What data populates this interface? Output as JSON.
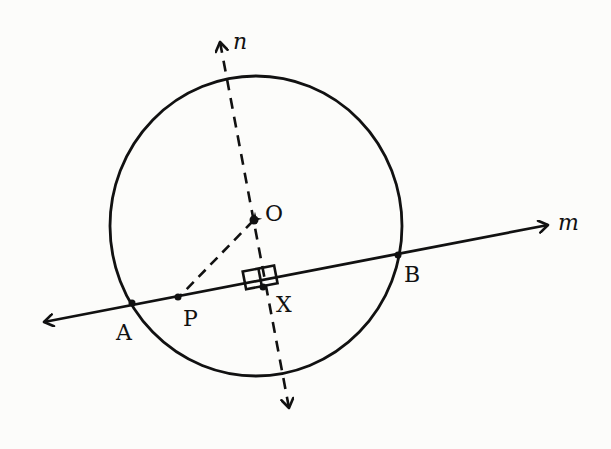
{
  "diagram": {
    "type": "geometry-circle-chord",
    "colors": {
      "ink": "#111111",
      "paper": "#fcfcfa"
    },
    "circle": {
      "center_label": "O",
      "cx": 256,
      "cy": 226,
      "rx": 146,
      "ry": 150
    },
    "lines": {
      "m": {
        "label": "m",
        "from": [
          44,
          322
        ],
        "to": [
          548,
          225
        ],
        "style": "solid",
        "arrows": "both"
      },
      "n": {
        "label": "n",
        "from": [
          220,
          40
        ],
        "to": [
          290,
          410
        ],
        "style": "dashed",
        "arrows": "both"
      },
      "OP": {
        "from": [
          254,
          220
        ],
        "to": [
          178,
          297
        ],
        "style": "dashed",
        "arrows": "none"
      }
    },
    "points": [
      {
        "label": "O",
        "x": 254,
        "y": 220
      },
      {
        "label": "A",
        "x": 132,
        "y": 303
      },
      {
        "label": "P",
        "x": 178,
        "y": 297
      },
      {
        "label": "X",
        "x": 263,
        "y": 287
      },
      {
        "label": "B",
        "x": 398,
        "y": 255
      }
    ],
    "labels": {
      "n": "n",
      "m": "m",
      "O": "O",
      "A": "A",
      "P": "P",
      "X": "X",
      "B": "B"
    },
    "right_angle_marker": {
      "at": "X",
      "size": 16
    }
  }
}
